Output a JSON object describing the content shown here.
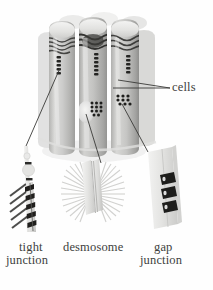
{
  "figure": {
    "background_color": "#fefefe",
    "ink_color": "#3a3a38",
    "cell_fill_color": "#c9c9c7",
    "cell_highlight_color": "#ececeb",
    "cell_shadow_color": "#a9a9a7",
    "junction_dark_color": "#2b2b29"
  },
  "labels": {
    "cells": "cells",
    "tight_line1": "tight",
    "tight_line2": "junction",
    "desmosome": "desmosome",
    "gap_line1": "gap",
    "gap_line2": "junction"
  },
  "diagram_data": {
    "type": "biological-illustration",
    "subject": "epithelial cell junctions",
    "main_structure": {
      "name": "column of epithelial cells",
      "shape": "three vertical cylinders with rounded tops",
      "count": 3,
      "callout": "cells"
    },
    "features_on_cells": [
      {
        "name": "tight-junction-belt",
        "appearance": "wavy dark bands near cell tops",
        "count": 3
      },
      {
        "name": "tight-junction-seam",
        "appearance": "vertical beaded dark strips between cells",
        "count": 3
      },
      {
        "name": "desmosome-spot",
        "appearance": "pale oval plaque on cell surface",
        "count": 1
      },
      {
        "name": "gap-junction-plaque",
        "appearance": "clusters of small dark dots",
        "count": 2
      }
    ],
    "detail_panels": [
      {
        "id": "tight-junction",
        "label_line1": "tight",
        "label_line2": "junction",
        "description": "two membranes fused at sealing strands, with diagonal hatched strand pattern and a ladder of dark sealing bars",
        "sealing_bars": 5,
        "hatch_strands": 5
      },
      {
        "id": "desmosome",
        "label_line1": "desmosome",
        "label_line2": "",
        "description": "two membrane plaques separated by a gap with radiating intermediate filaments on both sides",
        "filament_rays": 34
      },
      {
        "id": "gap-junction",
        "label_line1": "gap",
        "label_line2": "junction",
        "description": "membrane plate pierced by dark connexon channels linking the two cells",
        "connexons": 3
      }
    ]
  }
}
